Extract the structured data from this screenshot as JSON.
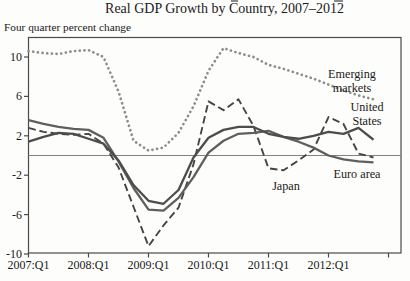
{
  "title": "Real GDP Growth by Country, 2007–2012",
  "units_label": "Four quarter percent change",
  "chart_data": {
    "type": "line",
    "title": "Real GDP Growth by Country, 2007–2012",
    "ylabel": "Four quarter percent change",
    "grid": false,
    "zero_line": true,
    "legend_position": "inline-annotations",
    "ylim": [
      -10.3,
      11.9
    ],
    "y_ticks": [
      10,
      6,
      2,
      -2,
      -6,
      -10
    ],
    "x_tick_labels": [
      "2007:Q1",
      "2008:Q1",
      "2009:Q1",
      "2010:Q1",
      "2011:Q1",
      "2012:Q1"
    ],
    "x": [
      "2007:Q1",
      "2007:Q2",
      "2007:Q3",
      "2007:Q4",
      "2008:Q1",
      "2008:Q2",
      "2008:Q3",
      "2008:Q4",
      "2009:Q1",
      "2009:Q2",
      "2009:Q3",
      "2009:Q4",
      "2010:Q1",
      "2010:Q2",
      "2010:Q3",
      "2010:Q4",
      "2011:Q1",
      "2011:Q2",
      "2011:Q3",
      "2011:Q4",
      "2012:Q1",
      "2012:Q2",
      "2012:Q3",
      "2012:Q4"
    ],
    "series": [
      {
        "name": "Emerging markets",
        "style": "dotted",
        "color": "#8d8d8d",
        "annotation": [
          "Emerging",
          "markets"
        ],
        "values": [
          10.6,
          10.4,
          10.3,
          10.6,
          10.7,
          10.0,
          6.5,
          1.5,
          0.5,
          0.8,
          2.3,
          5.0,
          8.6,
          10.9,
          10.4,
          10.0,
          9.2,
          8.8,
          8.3,
          7.8,
          7.2,
          6.6,
          6.1,
          5.7
        ]
      },
      {
        "name": "Japan",
        "style": "dashed",
        "color": "#454545",
        "annotation": [
          "Japan"
        ],
        "values": [
          2.8,
          2.4,
          2.2,
          2.1,
          2.2,
          1.2,
          -1.2,
          -5.2,
          -9.2,
          -7.1,
          -5.3,
          -0.9,
          5.5,
          4.6,
          5.7,
          3.0,
          -1.3,
          -1.5,
          -0.5,
          0.6,
          3.9,
          3.2,
          0.2,
          -0.2
        ]
      },
      {
        "name": "Euro area",
        "style": "solid",
        "color": "#5f5f5f",
        "annotation": [
          "Euro area"
        ],
        "values": [
          3.6,
          3.2,
          2.9,
          2.7,
          2.6,
          1.8,
          -0.6,
          -3.3,
          -5.5,
          -5.6,
          -4.3,
          -2.2,
          0.3,
          1.5,
          2.2,
          2.3,
          2.5,
          1.9,
          1.4,
          0.8,
          0.0,
          -0.4,
          -0.6,
          -0.7
        ]
      },
      {
        "name": "United States",
        "style": "solid",
        "color": "#4d4d4d",
        "annotation": [
          "United",
          "States"
        ],
        "values": [
          1.4,
          1.9,
          2.3,
          2.2,
          1.7,
          1.2,
          -0.5,
          -3.0,
          -4.6,
          -4.9,
          -3.5,
          -0.2,
          1.8,
          2.6,
          2.9,
          2.9,
          2.2,
          1.9,
          1.7,
          2.0,
          2.4,
          2.2,
          2.8,
          1.6
        ]
      }
    ]
  }
}
